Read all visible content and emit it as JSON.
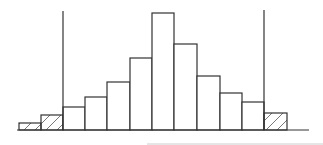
{
  "chart_data": {
    "type": "bar",
    "title": "",
    "xlabel": "",
    "ylabel": "",
    "grid": false,
    "legend": "none",
    "categories": [
      "1",
      "2",
      "3",
      "4",
      "5",
      "6",
      "7",
      "8",
      "9",
      "10",
      "11",
      "12"
    ],
    "values": [
      7,
      15,
      23,
      33,
      48,
      72,
      117,
      86,
      54,
      37,
      28,
      17
    ],
    "hatched": [
      true,
      true,
      false,
      false,
      false,
      false,
      false,
      false,
      false,
      false,
      false,
      true
    ],
    "cutoff_lines": [
      {
        "position": "between bins 2 and 3",
        "label": ""
      },
      {
        "position": "between bins 11 and 12",
        "label": ""
      }
    ],
    "ylim": [
      0,
      120
    ],
    "colors": {
      "stroke": "#333333",
      "fill": "#ffffff",
      "hatch": "#555555",
      "footer_rule": "#cccccc"
    }
  }
}
